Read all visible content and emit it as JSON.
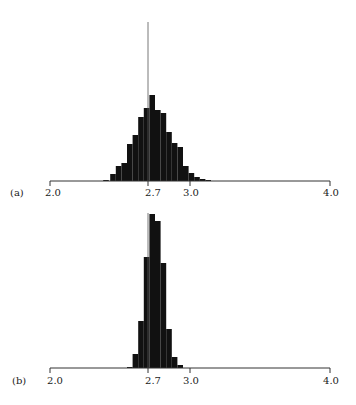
{
  "chart_data": [
    {
      "type": "bar",
      "panel": "(a)",
      "title": "",
      "xlabel": "",
      "ylabel": "",
      "xlim": [
        2.0,
        4.0
      ],
      "xticks": [
        2.0,
        2.7,
        3.0,
        4.0
      ],
      "xtick_labels": [
        "2.0",
        "2.7",
        "3.0",
        "4.0"
      ],
      "reference_line": 2.7,
      "grid": false,
      "bin_width": 0.04,
      "bins_left": [
        2.38,
        2.43,
        2.47,
        2.51,
        2.55,
        2.59,
        2.63,
        2.67,
        2.71,
        2.75,
        2.79,
        2.83,
        2.87,
        2.91,
        2.95,
        2.99,
        3.03,
        3.07,
        3.11
      ],
      "values": [
        1,
        7,
        15,
        18,
        37,
        46,
        64,
        73,
        86,
        71,
        68,
        49,
        38,
        34,
        15,
        8,
        4,
        2,
        1
      ],
      "units": "relative frequency (px height, peak = 86)"
    },
    {
      "type": "bar",
      "panel": "(b)",
      "title": "",
      "xlabel": "",
      "ylabel": "",
      "xlim": [
        2.0,
        4.0
      ],
      "xticks": [
        2.0,
        2.7,
        3.0,
        4.0
      ],
      "xtick_labels": [
        "2.0",
        "2.7",
        "3.0",
        "4.0"
      ],
      "reference_line": 2.7,
      "grid": false,
      "bin_width": 0.04,
      "bins_left": [
        2.55,
        2.59,
        2.63,
        2.67,
        2.71,
        2.75,
        2.79,
        2.83,
        2.87,
        2.91
      ],
      "values": [
        1,
        14,
        47,
        111,
        154,
        147,
        105,
        39,
        11,
        3
      ],
      "units": "relative frequency (px height, peak = 154)"
    }
  ],
  "panels": {
    "a": {
      "label": "(a)",
      "ticks": [
        "2.0",
        "2.7",
        "3.0",
        "4.0"
      ]
    },
    "b": {
      "label": "(b)",
      "ticks": [
        "2.0",
        "2.7",
        "3.0",
        "4.0"
      ]
    }
  }
}
